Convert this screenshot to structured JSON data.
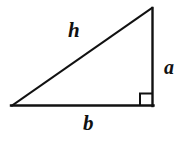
{
  "figure": {
    "type": "right-triangle-diagram",
    "background_color": "#ffffff",
    "stroke_color": "#111111",
    "stroke_width": 2,
    "vertices": {
      "left": [
        12,
        105
      ],
      "apex": [
        152,
        8
      ],
      "right_angle_corner": [
        153,
        106
      ]
    },
    "right_angle_marker": {
      "name": "right-angle-square",
      "x": 140,
      "y": 93,
      "size": 12
    },
    "labels": {
      "hypotenuse": "h",
      "vertical_leg": "a",
      "horizontal_leg": "b"
    }
  }
}
